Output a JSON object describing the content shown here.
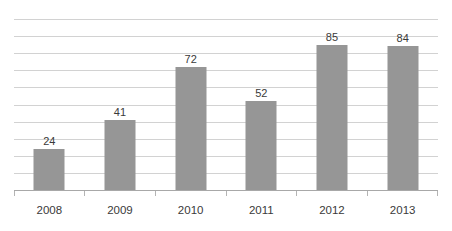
{
  "chart_data": {
    "type": "bar",
    "title": "",
    "subtitle": "",
    "xlabel": "",
    "ylabel": "",
    "categories": [
      "2008",
      "2009",
      "2010",
      "2011",
      "2012",
      "2013"
    ],
    "values": [
      24,
      41,
      72,
      52,
      85,
      84
    ],
    "data_labels": [
      "24",
      "41",
      "72",
      "52",
      "85",
      "84"
    ],
    "ylim": [
      0,
      100
    ],
    "y_tick_interval": 10,
    "y_tick_labels_visible": false,
    "gridlines": {
      "horizontal": true,
      "vertical": false,
      "count": 10,
      "color": "#d2d2d2"
    },
    "legend": {
      "visible": false,
      "entries": []
    },
    "series": [
      {
        "name": "Series 1",
        "color": "#969696",
        "values": [
          24,
          41,
          72,
          52,
          85,
          84
        ]
      }
    ],
    "axis_color": "#a8a8a8",
    "label_color": "#3a3a3a",
    "background": "#ffffff"
  }
}
